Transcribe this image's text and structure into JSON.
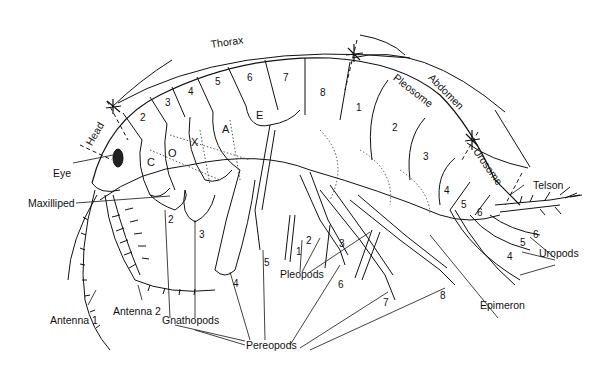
{
  "diagram": {
    "regions": {
      "head": "Head",
      "thorax": "Thorax",
      "abdomen": "Abdomen",
      "pleosome": "Pleosome",
      "urosome": "Urosome"
    },
    "labels": {
      "eye": "Eye",
      "maxilliped": "Maxilliped",
      "antenna1": "Antenna 1",
      "antenna2": "Antenna 2",
      "gnathopods": "Gnathopods",
      "pereopods": "Pereopods",
      "pleopods": "Pleopods",
      "epimeron": "Epimeron",
      "telson": "Telson",
      "uropods": "Uropods"
    },
    "coxa_letters": [
      "C",
      "O",
      "X",
      "A",
      "E"
    ],
    "thorax_segments": [
      "2",
      "3",
      "4",
      "5",
      "6",
      "7",
      "8"
    ],
    "pleosome_segments": [
      "1",
      "2",
      "3"
    ],
    "urosome_segments": [
      "4",
      "5",
      "6"
    ],
    "gnathopod_numbers": [
      "2",
      "3"
    ],
    "pereopod_numbers": [
      "4",
      "5",
      "6",
      "7",
      "8"
    ],
    "pleopod_numbers": [
      "1",
      "2",
      "3"
    ],
    "uropod_numbers": [
      "4",
      "5",
      "6"
    ]
  }
}
